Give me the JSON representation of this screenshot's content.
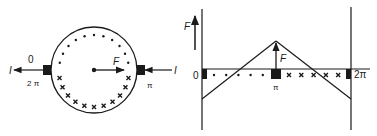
{
  "left_panel": {
    "title": "commutator-armature cross-section",
    "labels": {
      "current_left": "I",
      "current_right": "I",
      "angle_zero": "0",
      "angle_two_pi": "2 π",
      "angle_pi": "π",
      "force": "F"
    },
    "conductor_pattern": {
      "upper_half": "dot",
      "lower_half": "cross",
      "dot_count": 11,
      "cross_count": 11
    }
  },
  "right_panel": {
    "title": "force distribution unrolled",
    "labels": {
      "force_axis": "F",
      "force_at_pi": "F",
      "x_zero": "0",
      "x_pi": "π",
      "x_two_pi": "2π"
    },
    "conductor_pattern": {
      "left_half": "dot",
      "right_half": "cross",
      "dot_count": 5,
      "cross_count": 5
    }
  },
  "colors": {
    "ink": "#1a1a1a",
    "background": "#ffffff"
  }
}
